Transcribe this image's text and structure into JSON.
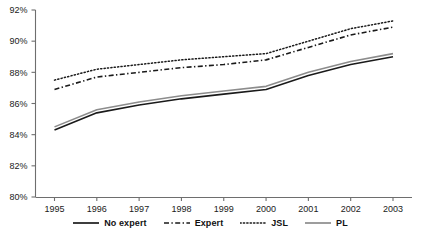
{
  "chart_data": {
    "type": "line",
    "title": "",
    "xlabel": "",
    "ylabel": "",
    "x": [
      1995,
      1996,
      1997,
      1998,
      1999,
      2000,
      2001,
      2002,
      2003
    ],
    "categories": [
      "1995",
      "1996",
      "1997",
      "1998",
      "1999",
      "2000",
      "2001",
      "2002",
      "2003"
    ],
    "ylim": [
      80,
      92
    ],
    "yticks": [
      80,
      82,
      84,
      86,
      88,
      90,
      92
    ],
    "ytick_labels": [
      "80%",
      "82%",
      "84%",
      "86%",
      "88%",
      "90%",
      "92%"
    ],
    "xlim": [
      1995,
      2003
    ],
    "grid": false,
    "legend_position": "bottom",
    "series": [
      {
        "name": "No expert",
        "style": "solid",
        "color": "#1a1a1a",
        "values": [
          84.3,
          85.4,
          85.9,
          86.3,
          86.6,
          86.9,
          87.8,
          88.5,
          89.0
        ]
      },
      {
        "name": "Expert",
        "style": "dash-dot",
        "color": "#1a1a1a",
        "values": [
          86.9,
          87.7,
          88.0,
          88.3,
          88.5,
          88.8,
          89.6,
          90.4,
          90.9
        ]
      },
      {
        "name": "JSL",
        "style": "dotted",
        "color": "#1a1a1a",
        "values": [
          87.5,
          88.2,
          88.5,
          88.8,
          89.0,
          89.2,
          90.0,
          90.8,
          91.3
        ]
      },
      {
        "name": "PL",
        "style": "solid",
        "color": "#8c8c8c",
        "values": [
          84.5,
          85.6,
          86.1,
          86.5,
          86.8,
          87.1,
          88.0,
          88.7,
          89.2
        ]
      }
    ]
  },
  "legend": {
    "items": [
      {
        "label": "No expert"
      },
      {
        "label": "Expert"
      },
      {
        "label": "JSL"
      },
      {
        "label": "PL"
      }
    ]
  }
}
